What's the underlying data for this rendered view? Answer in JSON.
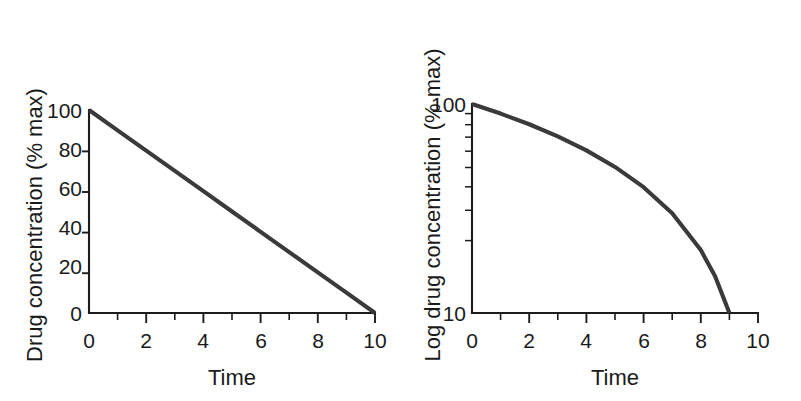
{
  "figure": {
    "background_color": "#ffffff",
    "line_color": "#3a3a3a",
    "axis_color": "#1c1c1c"
  },
  "chart_data": [
    {
      "type": "line",
      "panel": "left",
      "title": "",
      "xlabel": "Time",
      "ylabel": "Drug concentration (% max)",
      "xlim": [
        0,
        10
      ],
      "ylim": [
        0,
        100
      ],
      "yscale": "linear",
      "grid": false,
      "legend": "none",
      "x_ticklabels": [
        "0",
        "2",
        "4",
        "6",
        "8",
        "10"
      ],
      "x_tickvalues": [
        0,
        2,
        4,
        6,
        8,
        10
      ],
      "x_minor_tickvalues": [
        1,
        3,
        5,
        7,
        9
      ],
      "y_ticklabels": [
        "0",
        "20",
        "40",
        "60",
        "80",
        "100"
      ],
      "y_tickvalues": [
        0,
        20,
        40,
        60,
        80,
        100
      ],
      "series": [
        {
          "name": "Drug concentration",
          "x": [
            0,
            1,
            2,
            3,
            4,
            5,
            6,
            7,
            8,
            9,
            10
          ],
          "values": [
            100,
            90,
            80,
            70,
            60,
            50,
            40,
            30,
            20,
            10,
            0
          ]
        }
      ]
    },
    {
      "type": "line",
      "panel": "right",
      "title": "",
      "xlabel": "Time",
      "ylabel": "Log drug concentration (% max)",
      "xlim": [
        0,
        10
      ],
      "ylim": [
        10,
        100
      ],
      "yscale": "log",
      "grid": false,
      "legend": "none",
      "x_ticklabels": [
        "0",
        "2",
        "4",
        "6",
        "8",
        "10"
      ],
      "x_tickvalues": [
        0,
        2,
        4,
        6,
        8,
        10
      ],
      "x_minor_tickvalues": [
        1,
        3,
        5,
        7,
        9
      ],
      "y_ticklabels": [
        "10",
        "100"
      ],
      "y_tickvalues": [
        10,
        100
      ],
      "y_minor_tickvalues": [
        20,
        30,
        40,
        50,
        60,
        70,
        80,
        90
      ],
      "series": [
        {
          "name": "Log drug concentration",
          "x": [
            0,
            1,
            2,
            3,
            4,
            5,
            6,
            7,
            8,
            8.5,
            9
          ],
          "values": [
            100,
            90,
            80,
            70,
            60,
            50,
            40,
            30,
            20,
            15,
            10
          ]
        }
      ]
    }
  ],
  "left_panel": {
    "ylabel": "Drug concentration (% max)",
    "xlabel": "Time",
    "y_ticks": [
      {
        "label": "100",
        "value": 100
      },
      {
        "label": "80",
        "value": 80
      },
      {
        "label": "60",
        "value": 60
      },
      {
        "label": "40",
        "value": 40
      },
      {
        "label": "20",
        "value": 20
      },
      {
        "label": "0",
        "value": 0
      }
    ],
    "x_ticks": [
      {
        "label": "0",
        "value": 0
      },
      {
        "label": "2",
        "value": 2
      },
      {
        "label": "4",
        "value": 4
      },
      {
        "label": "6",
        "value": 6
      },
      {
        "label": "8",
        "value": 8
      },
      {
        "label": "10",
        "value": 10
      }
    ]
  },
  "right_panel": {
    "ylabel": "Log drug concentration (% max)",
    "xlabel": "Time",
    "y_ticks": [
      {
        "label": "100",
        "value": 100
      },
      {
        "label": "10",
        "value": 10
      }
    ],
    "x_ticks": [
      {
        "label": "0",
        "value": 0
      },
      {
        "label": "2",
        "value": 2
      },
      {
        "label": "4",
        "value": 4
      },
      {
        "label": "6",
        "value": 6
      },
      {
        "label": "8",
        "value": 8
      },
      {
        "label": "10",
        "value": 10
      }
    ]
  }
}
